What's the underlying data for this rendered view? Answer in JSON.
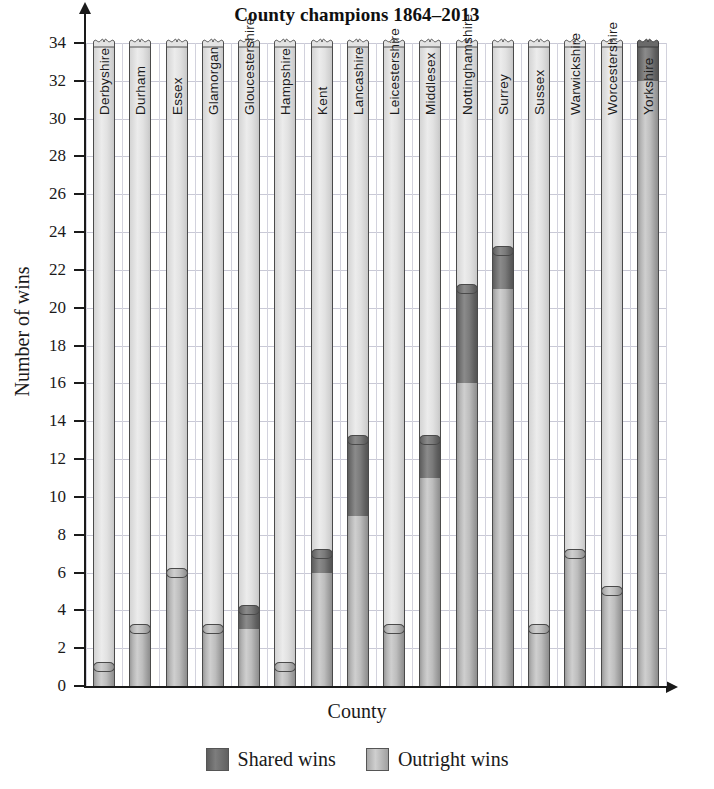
{
  "chart_data": {
    "type": "bar",
    "title": "County champions 1864–2013",
    "xlabel": "County",
    "ylabel": "Number of wins",
    "ylim": [
      0,
      34
    ],
    "ytick_step": 2,
    "yticks": [
      0,
      2,
      4,
      6,
      8,
      10,
      12,
      14,
      16,
      18,
      20,
      22,
      24,
      26,
      28,
      30,
      32,
      34
    ],
    "grid": true,
    "stacked": true,
    "legend_position": "bottom",
    "legend": [
      "Shared wins",
      "Outright wins"
    ],
    "categories": [
      "Derbyshire",
      "Durham",
      "Essex",
      "Glamorgan",
      "Gloucestershire",
      "Hampshire",
      "Kent",
      "Lancashire",
      "Leicestershire",
      "Middlesex",
      "Nottinghamshire",
      "Surrey",
      "Sussex",
      "Warwickshire",
      "Worcestershire",
      "Yorkshire"
    ],
    "series": [
      {
        "name": "Outright wins",
        "color": "#c0c0c0",
        "values": [
          1,
          3,
          6,
          3,
          3,
          1,
          6,
          9,
          3,
          11,
          16,
          21,
          3,
          7,
          5,
          32
        ]
      },
      {
        "name": "Shared wins",
        "color": "#6b6b6b",
        "values": [
          0,
          0,
          0,
          0,
          1,
          0,
          1,
          4,
          0,
          2,
          5,
          2,
          0,
          0,
          0,
          2
        ]
      }
    ],
    "totals": [
      1,
      3,
      6,
      3,
      4,
      1,
      7,
      13,
      3,
      13,
      21,
      23,
      3,
      7,
      5,
      34
    ],
    "note": "Yorkshire bar is drawn broken at the top of the axis"
  },
  "legend": {
    "items": [
      {
        "label": "Shared wins",
        "swatch": "shared"
      },
      {
        "label": "Outright wins",
        "swatch": "outright"
      }
    ]
  }
}
